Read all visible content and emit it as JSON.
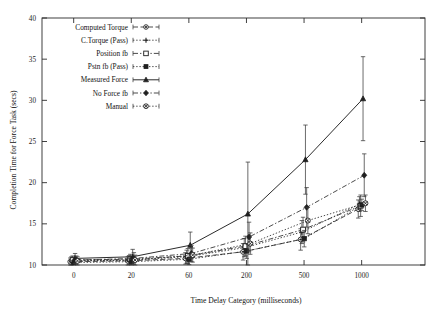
{
  "chart_data": {
    "type": "line",
    "title": "",
    "xlabel": "Time Delay Category (milliseconds)",
    "ylabel": "Completion Time for Force Task (secs)",
    "x_tick_labels": [
      "0",
      "20",
      "60",
      "200",
      "500",
      "1000"
    ],
    "x_tick_values": [
      0,
      20,
      60,
      200,
      500,
      1000
    ],
    "y_tick_labels": [
      "10",
      "15",
      "20",
      "25",
      "30",
      "35",
      "40"
    ],
    "y_tick_values": [
      10,
      15,
      20,
      25,
      30,
      35,
      40
    ],
    "ylim": [
      10,
      40
    ],
    "xlim_category_index": [
      -0.55,
      6.1
    ],
    "grid": false,
    "legend_position": "top-left",
    "error_bars": "vertical",
    "x_categories": [
      0,
      20,
      60,
      200,
      500,
      1000
    ],
    "series": [
      {
        "name": "Computed Torque",
        "marker": "circle-dot",
        "linestyle": "dashed",
        "values": [
          10.4,
          10.5,
          10.8,
          11.6,
          13.1,
          16.8
        ],
        "errors": [
          0.45,
          0.5,
          0.7,
          1.0,
          1.3,
          1.1
        ]
      },
      {
        "name": "C.Torque (Pass)",
        "marker": "plus",
        "linestyle": "dotted",
        "values": [
          10.5,
          10.6,
          11.0,
          12.1,
          14.0,
          17.4
        ],
        "errors": [
          0.5,
          0.55,
          0.8,
          1.1,
          1.4,
          0.9
        ]
      },
      {
        "name": "Position fb",
        "marker": "open-square",
        "linestyle": "dash-dot",
        "values": [
          10.6,
          10.7,
          11.1,
          12.3,
          14.3,
          17.2
        ],
        "errors": [
          0.5,
          0.6,
          0.9,
          1.2,
          1.5,
          1.3
        ]
      },
      {
        "name": "Pstn fb (Pass)",
        "marker": "filled-square",
        "linestyle": "dotted",
        "values": [
          10.3,
          10.4,
          10.7,
          11.7,
          13.2,
          17.3
        ],
        "errors": [
          0.4,
          0.45,
          0.65,
          0.9,
          1.0,
          0.7
        ]
      },
      {
        "name": "Measured Force",
        "marker": "filled-triangle",
        "linestyle": "solid",
        "values": [
          10.8,
          11.0,
          12.4,
          16.2,
          22.8,
          30.2
        ],
        "errors": [
          0.6,
          0.9,
          1.6,
          6.3,
          4.2,
          5.1
        ]
      },
      {
        "name": "No Force fb",
        "marker": "filled-diamond",
        "linestyle": "dash-dot",
        "values": [
          10.6,
          10.8,
          11.4,
          13.4,
          17.0,
          20.9
        ],
        "errors": [
          0.5,
          0.7,
          1.0,
          1.8,
          2.4,
          2.6
        ]
      },
      {
        "name": "Manual",
        "marker": "circle-cross",
        "linestyle": "dotted",
        "values": [
          10.5,
          10.6,
          11.2,
          12.6,
          15.4,
          17.5
        ],
        "errors": [
          0.5,
          0.6,
          0.85,
          1.3,
          1.6,
          1.0
        ]
      }
    ]
  },
  "legend": {
    "entries": [
      "Computed Torque",
      "C.Torque (Pass)",
      "Position fb",
      "Pstn fb (Pass)",
      "Measured Force",
      "No Force fb",
      "Manual"
    ]
  },
  "colors": {
    "ink": "#2b2b2b",
    "background": "#ffffff"
  }
}
